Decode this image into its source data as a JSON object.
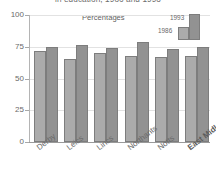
{
  "chart_data": {
    "type": "bar",
    "title": "in education, 1986 and 1993",
    "subtitle": "Percentages",
    "xlabel": "",
    "ylabel": "",
    "ylim": [
      0,
      100
    ],
    "yticks": [
      0,
      25,
      50,
      75,
      100
    ],
    "ytick_labels": [
      "0",
      "25",
      "50",
      "75",
      "100"
    ],
    "grid": true,
    "legend_position": "top-right",
    "categories": [
      "Derby",
      "Leics",
      "Lincs",
      "Northants",
      "Notts",
      "East Midlands"
    ],
    "series": [
      {
        "name": "1986",
        "color": "#ababab",
        "values": [
          72,
          65,
          70,
          68,
          67,
          68
        ]
      },
      {
        "name": "1993",
        "color": "#929292",
        "values": [
          75,
          76,
          74,
          78.5,
          73,
          75
        ]
      }
    ]
  },
  "legend": {
    "items": [
      {
        "label": "1993"
      },
      {
        "label": "1986"
      }
    ]
  },
  "colors": {
    "bar_1986": "#ababab",
    "bar_1993": "#929292",
    "bar_outline": "#7d7d7d",
    "gridline": "#e2e2e2",
    "axis": "#9a9a9a",
    "text": "#6a6a6a",
    "background": "#ffffff"
  }
}
